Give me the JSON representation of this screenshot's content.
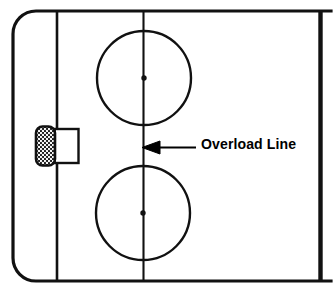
{
  "diagram": {
    "colors": {
      "line": "#111111",
      "ice": "#ffffff",
      "text": "#000000",
      "net_mesh": "#1a1a1a"
    },
    "annotations": [
      {
        "id": "overload-line",
        "label": "Overload Line",
        "arrow": "left",
        "target": "center-vertical-line"
      }
    ],
    "features": {
      "boards_label": "rink-boards",
      "goal_line_label": "goal-line",
      "blue_line_label": "blue-line",
      "overload_line_label": "overload-line",
      "goal_net_label": "goal-net",
      "crease_label": "goal-crease",
      "faceoff_circle_top_label": "faceoff-circle-top",
      "faceoff_circle_bottom_label": "faceoff-circle-bottom",
      "faceoff_dot_top_label": "faceoff-dot-top",
      "faceoff_dot_bottom_label": "faceoff-dot-bottom"
    },
    "geometry": {
      "width": 335,
      "height": 297,
      "boards": {
        "x": 13,
        "y": 11,
        "w": 318,
        "h": 270,
        "corner_radius": 23
      },
      "goal_line_x": 57,
      "blue_line_x": 320.5,
      "overload_line_x": 143,
      "faceoff_circles": [
        {
          "cx": 144,
          "cy": 78,
          "r": 47
        },
        {
          "cx": 143,
          "cy": 213,
          "r": 47
        }
      ],
      "faceoff_dots": [
        {
          "cx": 144,
          "cy": 78,
          "r": 2.6
        },
        {
          "cx": 143,
          "cy": 213,
          "r": 2.6
        }
      ],
      "net": {
        "x": 36,
        "y": 127,
        "w": 18,
        "h": 38
      },
      "crease_rect": {
        "x": 54,
        "y": 129,
        "w": 24,
        "h": 34
      },
      "arrow": {
        "tip_x": 142,
        "tail_x": 196,
        "y": 148
      }
    }
  }
}
